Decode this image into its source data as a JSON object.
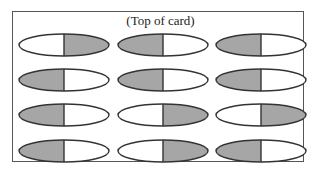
{
  "title": "(Top of card)",
  "colors": {
    "fill": "#a6a6a6",
    "stroke": "#333333",
    "empty": "#ffffff"
  },
  "grid": [
    [
      "right",
      "left",
      "left"
    ],
    [
      "left",
      "left",
      "left"
    ],
    [
      "left",
      "right",
      "right"
    ],
    [
      "left",
      "right",
      "left"
    ]
  ]
}
